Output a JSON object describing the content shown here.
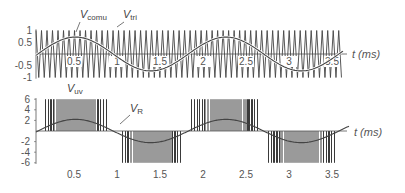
{
  "chart_data": [
    {
      "type": "line",
      "panel": "top",
      "title": "",
      "xlabel": "t (ms)",
      "ylabel": "",
      "xlim": [
        0.08,
        3.65
      ],
      "ylim": [
        -1,
        1
      ],
      "grid": false,
      "x_ticks": [
        "0.5",
        "1",
        "1.5",
        "2",
        "2.5",
        "3",
        "3.5"
      ],
      "y_ticks": [
        "1",
        "0.5",
        "-0.5",
        "-1"
      ],
      "series": [
        {
          "name": "V_comu",
          "label_main": "V",
          "label_sub": "comu",
          "kind": "sine",
          "amplitude": 0.72,
          "period_ms": 1.75,
          "phase_ms": 0.08
        },
        {
          "name": "V_tri",
          "label_main": "V",
          "label_sub": "tri",
          "kind": "triangle",
          "amplitude": 1.0,
          "carrier_period_ms": 0.064
        }
      ]
    },
    {
      "type": "line",
      "panel": "bottom",
      "title": "",
      "xlabel": "t (ms)",
      "ylabel": "",
      "xlim": [
        0.08,
        3.65
      ],
      "ylim": [
        -6,
        6
      ],
      "grid": false,
      "x_ticks": [
        "0.5",
        "1",
        "1.5",
        "2",
        "2.5",
        "3",
        "3.5"
      ],
      "y_ticks": [
        "6",
        "4",
        "2",
        "-2",
        "-4",
        "-6"
      ],
      "series": [
        {
          "name": "V_uv",
          "label_main": "V",
          "label_sub": "uv",
          "kind": "pwm",
          "levels": [
            6,
            -6
          ]
        },
        {
          "name": "V_R",
          "label_main": "V",
          "label_sub": "R",
          "kind": "sine",
          "amplitude": 2.2,
          "period_ms": 1.75,
          "phase_ms": 0.08
        }
      ]
    }
  ],
  "labels": {
    "top_xaxis": "t (ms)",
    "bottom_xaxis": "t (ms)",
    "v_comu_main": "V",
    "v_comu_sub": "comu",
    "v_tri_main": "V",
    "v_tri_sub": "tri",
    "v_uv_main": "V",
    "v_uv_sub": "uv",
    "v_r_main": "V",
    "v_r_sub": "R"
  },
  "colors": {
    "trace": "#444444",
    "pwm_dark": "#3a3a3a",
    "pwm_light": "#9a9a9a",
    "axis": "#555555"
  }
}
